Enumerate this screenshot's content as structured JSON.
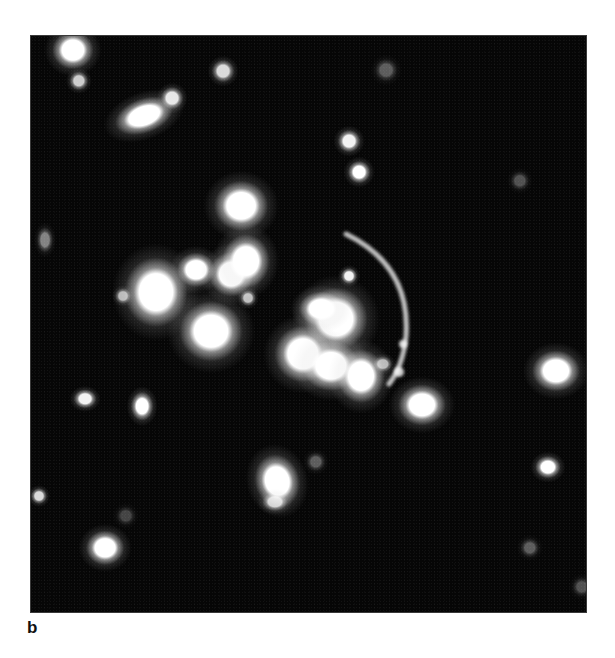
{
  "figure": {
    "panel_label": "b",
    "colors": {
      "background": "#060606",
      "source": "#ffffff",
      "page": "#ffffff"
    }
  },
  "sources": [
    {
      "x": 42,
      "y": 14,
      "rx": 13,
      "ry": 12,
      "b": 1.0
    },
    {
      "x": 48,
      "y": 45,
      "rx": 6,
      "ry": 6,
      "b": 0.8
    },
    {
      "x": 113,
      "y": 80,
      "rx": 19,
      "ry": 11,
      "b": 1.0,
      "rot": -20
    },
    {
      "x": 141,
      "y": 62,
      "rx": 7,
      "ry": 7,
      "b": 0.9
    },
    {
      "x": 192,
      "y": 35,
      "rx": 7,
      "ry": 7,
      "b": 0.85
    },
    {
      "x": 355,
      "y": 34,
      "rx": 7,
      "ry": 7,
      "b": 0.35
    },
    {
      "x": 318,
      "y": 105,
      "rx": 7,
      "ry": 7,
      "b": 0.95
    },
    {
      "x": 328,
      "y": 136,
      "rx": 7,
      "ry": 7,
      "b": 1.0
    },
    {
      "x": 489,
      "y": 145,
      "rx": 6,
      "ry": 6,
      "b": 0.3
    },
    {
      "x": 210,
      "y": 170,
      "rx": 17,
      "ry": 16,
      "b": 1.0
    },
    {
      "x": 125,
      "y": 256,
      "rx": 20,
      "ry": 22,
      "b": 1.0
    },
    {
      "x": 92,
      "y": 260,
      "rx": 5,
      "ry": 5,
      "b": 0.7
    },
    {
      "x": 165,
      "y": 234,
      "rx": 12,
      "ry": 11,
      "b": 1.0
    },
    {
      "x": 200,
      "y": 238,
      "rx": 14,
      "ry": 14,
      "b": 1.0
    },
    {
      "x": 215,
      "y": 225,
      "rx": 15,
      "ry": 17,
      "b": 1.0
    },
    {
      "x": 180,
      "y": 295,
      "rx": 20,
      "ry": 19,
      "b": 1.0
    },
    {
      "x": 217,
      "y": 262,
      "rx": 5,
      "ry": 5,
      "b": 0.75
    },
    {
      "x": 14,
      "y": 204,
      "rx": 5,
      "ry": 8,
      "b": 0.5
    },
    {
      "x": 318,
      "y": 240,
      "rx": 5,
      "ry": 5,
      "b": 0.95
    },
    {
      "x": 305,
      "y": 283,
      "rx": 20,
      "ry": 20,
      "b": 1.0
    },
    {
      "x": 290,
      "y": 273,
      "rx": 14,
      "ry": 11,
      "b": 1.0
    },
    {
      "x": 272,
      "y": 318,
      "rx": 18,
      "ry": 18,
      "b": 1.0
    },
    {
      "x": 300,
      "y": 330,
      "rx": 18,
      "ry": 16,
      "b": 1.0
    },
    {
      "x": 330,
      "y": 340,
      "rx": 15,
      "ry": 17,
      "b": 1.0
    },
    {
      "x": 352,
      "y": 328,
      "rx": 6,
      "ry": 5,
      "b": 0.7
    },
    {
      "x": 391,
      "y": 369,
      "rx": 15,
      "ry": 13,
      "b": 1.0
    },
    {
      "x": 525,
      "y": 335,
      "rx": 15,
      "ry": 13,
      "b": 1.0
    },
    {
      "x": 517,
      "y": 431,
      "rx": 8,
      "ry": 7,
      "b": 1.0
    },
    {
      "x": 54,
      "y": 363,
      "rx": 7,
      "ry": 6,
      "b": 0.95
    },
    {
      "x": 111,
      "y": 370,
      "rx": 7,
      "ry": 9,
      "b": 1.0
    },
    {
      "x": 8,
      "y": 460,
      "rx": 5,
      "ry": 5,
      "b": 0.85
    },
    {
      "x": 74,
      "y": 512,
      "rx": 12,
      "ry": 11,
      "b": 1.0
    },
    {
      "x": 246,
      "y": 445,
      "rx": 14,
      "ry": 17,
      "b": 1.0,
      "rot": -15
    },
    {
      "x": 244,
      "y": 466,
      "rx": 8,
      "ry": 6,
      "b": 0.8
    },
    {
      "x": 285,
      "y": 426,
      "rx": 6,
      "ry": 6,
      "b": 0.35
    },
    {
      "x": 499,
      "y": 512,
      "rx": 6,
      "ry": 6,
      "b": 0.35
    },
    {
      "x": 551,
      "y": 551,
      "rx": 6,
      "ry": 6,
      "b": 0.3
    },
    {
      "x": 95,
      "y": 480,
      "rx": 6,
      "ry": 6,
      "b": 0.25
    }
  ],
  "arc": {
    "path": "M 315 198 Q 380 230 375 300 Q 372 330 358 348",
    "width": 5,
    "opacity": 0.75,
    "knots": [
      {
        "x": 368,
        "y": 336,
        "r": 5
      },
      {
        "x": 372,
        "y": 308,
        "r": 4
      }
    ]
  }
}
